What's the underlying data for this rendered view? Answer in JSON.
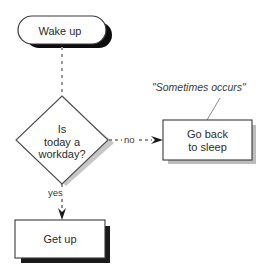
{
  "diagram": {
    "background_color": "#ffffff",
    "nodes": [
      {
        "id": "wake-up",
        "shape": "stadium",
        "label": "Wake up",
        "text_color": "#2b2b2b",
        "fill": "#ffffff",
        "stroke": "#3a3a3a",
        "shadow": "#0d0d0d"
      },
      {
        "id": "decision",
        "shape": "diamond",
        "label": "Is\ntoday a\nworkday?",
        "text_color": "#2b2b2b",
        "fill": "#ffffff",
        "stroke": "#4a4a4a",
        "shadow": "#a8a8a8"
      },
      {
        "id": "go-back-to-sleep",
        "shape": "rectangle",
        "label": "Go back\nto sleep",
        "text_color": "#2b2b2b",
        "fill": "#ffffff",
        "stroke": "#3a3a3a",
        "shadow": "#b4b4b4"
      },
      {
        "id": "get-up",
        "shape": "rectangle",
        "label": "Get up",
        "text_color": "#2b2b2b",
        "fill": "#ffffff",
        "stroke": "#3a3a3a",
        "shadow": "#1a1a1a"
      }
    ],
    "edges": [
      {
        "id": "wake-to-decision",
        "label": "",
        "style": "dashed",
        "color": "#9a9a9a",
        "arrow": false
      },
      {
        "id": "decision-to-sleep",
        "label": "no",
        "style": "dashed",
        "color": "#6e6e6e",
        "arrow": true
      },
      {
        "id": "decision-to-getup",
        "label": "yes",
        "style": "dashed",
        "color": "#6e6e6e",
        "arrow": true
      }
    ],
    "annotations": [
      {
        "id": "sometimes-occurs",
        "text": "\"Sometimes occurs\"",
        "style": "italic",
        "color": "#3a3a3a",
        "leader_line_color": "#8a8a8a"
      }
    ]
  }
}
